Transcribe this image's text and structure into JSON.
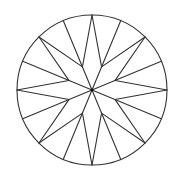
{
  "figure": {
    "canvas": {
      "width": 178,
      "height": 177,
      "background": "#ffffff"
    },
    "stroke_color": "#333333",
    "stroke_width": 1.1,
    "circle": {
      "cx": 92,
      "cy": 90,
      "r": 75
    },
    "inner_radius": 25,
    "outer_points_count": 16,
    "inner_vertices_count": 8,
    "outer_points": [
      [
        167.0,
        90.0
      ],
      [
        161.29,
        61.3
      ],
      [
        145.03,
        36.97
      ],
      [
        120.7,
        20.71
      ],
      [
        92.0,
        15.0
      ],
      [
        63.3,
        20.71
      ],
      [
        38.97,
        36.97
      ],
      [
        22.71,
        61.3
      ],
      [
        17.0,
        90.0
      ],
      [
        22.71,
        118.7
      ],
      [
        38.97,
        143.03
      ],
      [
        63.3,
        159.29
      ],
      [
        92.0,
        165.0
      ],
      [
        120.7,
        159.29
      ],
      [
        145.03,
        143.03
      ],
      [
        161.29,
        118.7
      ]
    ],
    "inner_vertices": [
      [
        115.1,
        80.43
      ],
      [
        101.57,
        66.9
      ],
      [
        82.43,
        66.9
      ],
      [
        68.9,
        80.43
      ],
      [
        68.9,
        99.57
      ],
      [
        82.43,
        113.1
      ],
      [
        101.57,
        113.1
      ],
      [
        115.1,
        99.57
      ]
    ],
    "center_dot_radius": 1.4
  }
}
